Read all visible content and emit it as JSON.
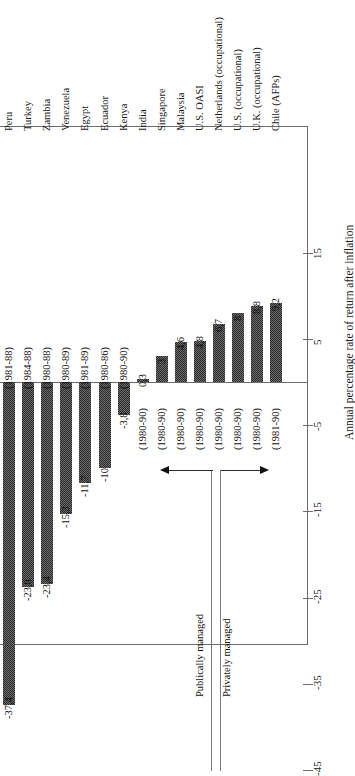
{
  "chart_data": {
    "type": "bar",
    "title": "",
    "xlabel": "",
    "ylabel": "Annual percentage rate of return after inflation",
    "orientation": "rotated-90",
    "ylim": [
      -45,
      15
    ],
    "yticks": [
      15,
      5,
      -5,
      -15,
      -25,
      -35,
      -45
    ],
    "ytick_labels": [
      "15",
      "5",
      "-5",
      "-15",
      "-25",
      "-35",
      "-45"
    ],
    "grid": false,
    "legend": null,
    "categories": [
      "Peru",
      "Turkey",
      "Zambia",
      "Venezuela",
      "Egypt",
      "Ecuador",
      "Kenya",
      "India",
      "Singapore",
      "Malaysia",
      "U.S. OASI",
      "Netherlands (occupational)",
      "U.S. (occupational)",
      "U.K. (occupational)",
      "Chile (AFPs)"
    ],
    "values": [
      -37.4,
      -23.8,
      -23.4,
      -15.3,
      -11.7,
      -10,
      -3.8,
      0.3,
      3,
      4.6,
      4.8,
      6.7,
      8,
      8.8,
      9.2
    ],
    "value_labels": [
      "-37,4",
      "-23,8",
      "-23,4",
      "-15,3",
      "-11,7",
      "-10",
      "-3,8",
      "0,3",
      "3",
      "4,6",
      "4,8",
      "6,7",
      "8",
      "8,8",
      "9,2"
    ],
    "periods": [
      "(1981-88)",
      "(1984-88)",
      "(1980-88)",
      "(1980-89)",
      "(1981-89)",
      "(1980-86)",
      "(1980-90)",
      "(1980-90)",
      "(1980-90)",
      "(1980-90)",
      "(1980-90)",
      "(1980-90)",
      "(1980-90)",
      "(1980-90)",
      "(1981-90)"
    ],
    "annotations": [
      {
        "name": "group-publically-managed",
        "text": "Publically managed"
      },
      {
        "name": "group-privately-managed",
        "text": "Privately managed"
      }
    ]
  },
  "colors": {
    "bar_fill": "#6b6b6b",
    "bar_pattern": "#2b2b2b",
    "axis": "#6d6d6d",
    "text": "#1a1a1a",
    "divider": "#7b7b7b"
  }
}
